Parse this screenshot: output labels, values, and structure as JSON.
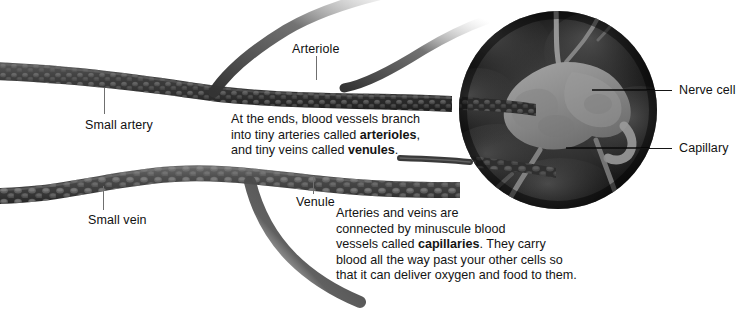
{
  "figure": {
    "background_color": "#ffffff",
    "width": 750,
    "height": 313
  },
  "labels": [
    {
      "id": "small-artery",
      "text": "Small artery",
      "x": 85,
      "y": 118,
      "leader": {
        "type": "vertical",
        "x": 104,
        "y1": 88,
        "y2": 114
      }
    },
    {
      "id": "arteriole",
      "text": "Arteriole",
      "x": 292,
      "y": 48,
      "leader": {
        "type": "vertical",
        "x": 316,
        "y1": 56,
        "y2": 80
      }
    },
    {
      "id": "small-vein",
      "text": "Small vein",
      "x": 88,
      "y": 218,
      "leader": {
        "type": "vertical",
        "x": 103,
        "y1": 186,
        "y2": 210
      }
    },
    {
      "id": "venule",
      "text": "Venule",
      "x": 296,
      "y": 201,
      "leader": {
        "type": "vertical",
        "x": 313,
        "y1": 176,
        "y2": 194
      }
    },
    {
      "id": "nerve-cell",
      "text": "Nerve cell",
      "x": 679,
      "y": 85,
      "leader": {
        "type": "horizontal",
        "y": 90,
        "x1": 640,
        "x2": 672
      }
    },
    {
      "id": "capillary",
      "text": "Capillary",
      "x": 679,
      "y": 143,
      "leader": {
        "type": "horizontal",
        "y": 148,
        "x1": 636,
        "x2": 672
      }
    }
  ],
  "paragraphs": [
    {
      "id": "arterioles-venules",
      "x": 231,
      "y": 112,
      "lines": [
        [
          {
            "t": "At the ends, blood vessels branch",
            "b": false
          }
        ],
        [
          {
            "t": "into tiny arteries called ",
            "b": false
          },
          {
            "t": "arterioles",
            "b": true
          },
          {
            "t": ",",
            "b": false
          }
        ],
        [
          {
            "t": "and tiny veins called ",
            "b": false
          },
          {
            "t": "venules",
            "b": true
          },
          {
            "t": ".",
            "b": false
          }
        ]
      ]
    },
    {
      "id": "capillaries",
      "x": 336,
      "y": 206,
      "lines": [
        [
          {
            "t": "Arteries and veins are",
            "b": false
          }
        ],
        [
          {
            "t": "connected by minuscule blood",
            "b": false
          }
        ],
        [
          {
            "t": "vessels called ",
            "b": false
          },
          {
            "t": "capillaries",
            "b": true
          },
          {
            "t": ". They carry",
            "b": false
          }
        ],
        [
          {
            "t": "blood all the way past your other cells so",
            "b": false
          }
        ],
        [
          {
            "t": "that it can deliver oxygen and food to them.",
            "b": false
          }
        ]
      ]
    }
  ],
  "artwork": {
    "inset_circle": {
      "cx": 558,
      "cy": 110,
      "r": 99,
      "fill_outer": "#121212",
      "fill_inner": "#3c3c3c"
    },
    "nerve_cell": {
      "fill": "#8e8e8e",
      "description": "irregular light-gray nerve cell body with branching capillary processes"
    },
    "artery": {
      "color": "#3b3b3b",
      "texture": "bumpy muscle-cell cobblestone"
    },
    "vein": {
      "color": "#4a4a4a",
      "texture": "large rounded muscle-cell bumps"
    },
    "capillary_color": "#9a9a9a"
  }
}
